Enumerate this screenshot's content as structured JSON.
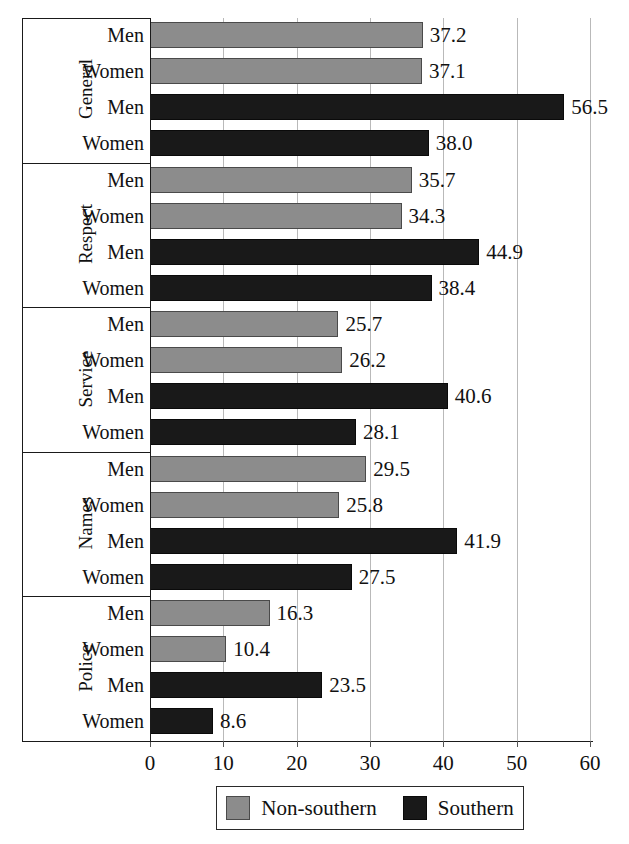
{
  "chart_data": {
    "type": "bar",
    "orientation": "horizontal",
    "title": "",
    "xlabel": "",
    "ylabel": "",
    "xlim": [
      0,
      60
    ],
    "xticks": [
      0,
      10,
      20,
      30,
      40,
      50,
      60
    ],
    "xtick_labels": [
      "0",
      "10",
      "20",
      "30",
      "40",
      "50",
      "60"
    ],
    "grid": true,
    "legend_position": "bottom",
    "series": [
      {
        "name": "Non-southern",
        "color": "#8c8c8c",
        "values": [
          37.2,
          37.1,
          35.7,
          34.3,
          25.7,
          26.2,
          29.5,
          25.8,
          16.3,
          10.4
        ]
      },
      {
        "name": "Southern",
        "color": "#191919",
        "values": [
          56.5,
          38.0,
          44.9,
          38.4,
          40.6,
          28.1,
          41.9,
          27.5,
          23.5,
          8.6
        ]
      }
    ],
    "groups": [
      {
        "label": "General",
        "rows": [
          {
            "label": "Men",
            "series": "Non-southern",
            "value": 37.2,
            "value_label": "37.2"
          },
          {
            "label": "Women",
            "series": "Non-southern",
            "value": 37.1,
            "value_label": "37.1"
          },
          {
            "label": "Men",
            "series": "Southern",
            "value": 56.5,
            "value_label": "56.5"
          },
          {
            "label": "Women",
            "series": "Southern",
            "value": 38.0,
            "value_label": "38.0"
          }
        ]
      },
      {
        "label": "Respect",
        "rows": [
          {
            "label": "Men",
            "series": "Non-southern",
            "value": 35.7,
            "value_label": "35.7"
          },
          {
            "label": "Women",
            "series": "Non-southern",
            "value": 34.3,
            "value_label": "34.3"
          },
          {
            "label": "Men",
            "series": "Southern",
            "value": 44.9,
            "value_label": "44.9"
          },
          {
            "label": "Women",
            "series": "Southern",
            "value": 38.4,
            "value_label": "38.4"
          }
        ]
      },
      {
        "label": "Service",
        "rows": [
          {
            "label": "Men",
            "series": "Non-southern",
            "value": 25.7,
            "value_label": "25.7"
          },
          {
            "label": "Women",
            "series": "Non-southern",
            "value": 26.2,
            "value_label": "26.2"
          },
          {
            "label": "Men",
            "series": "Southern",
            "value": 40.6,
            "value_label": "40.6"
          },
          {
            "label": "Women",
            "series": "Southern",
            "value": 28.1,
            "value_label": "28.1"
          }
        ]
      },
      {
        "label": "Names",
        "rows": [
          {
            "label": "Men",
            "series": "Non-southern",
            "value": 29.5,
            "value_label": "29.5"
          },
          {
            "label": "Women",
            "series": "Non-southern",
            "value": 25.8,
            "value_label": "25.8"
          },
          {
            "label": "Men",
            "series": "Southern",
            "value": 41.9,
            "value_label": "41.9"
          },
          {
            "label": "Women",
            "series": "Southern",
            "value": 27.5,
            "value_label": "27.5"
          }
        ]
      },
      {
        "label": "Police",
        "rows": [
          {
            "label": "Men",
            "series": "Non-southern",
            "value": 16.3,
            "value_label": "16.3"
          },
          {
            "label": "Women",
            "series": "Non-southern",
            "value": 10.4,
            "value_label": "10.4"
          },
          {
            "label": "Men",
            "series": "Southern",
            "value": 23.5,
            "value_label": "23.5"
          },
          {
            "label": "Women",
            "series": "Southern",
            "value": 8.6,
            "value_label": "8.6"
          }
        ]
      }
    ],
    "legend": [
      {
        "label": "Non-southern",
        "color": "#8c8c8c"
      },
      {
        "label": "Southern",
        "color": "#191919"
      }
    ]
  }
}
